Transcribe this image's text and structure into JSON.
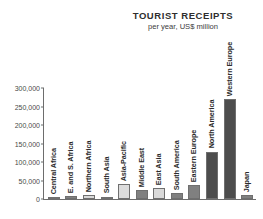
{
  "chart_data": {
    "type": "bar",
    "title": "TOURIST RECEIPTS",
    "subtitle": "per year, US$ million",
    "xlabel": "",
    "ylabel": "",
    "ylim": [
      0,
      300000
    ],
    "grid": false,
    "legend": "none",
    "ytick_labels": [
      "300,000",
      "250,000",
      "200,000",
      "150,000",
      "100,000",
      "50,000",
      "0"
    ],
    "ytick_values": [
      300000,
      250000,
      200000,
      150000,
      100000,
      50000,
      0
    ],
    "categories": [
      "Central Africa",
      "E. and S. Africa",
      "Northern Africa",
      "South Asia",
      "Asia-Pacific",
      "Middle East",
      "East Asia",
      "South America",
      "Eastern Europe",
      "North America",
      "Western Europe",
      "Japan"
    ],
    "values": [
      1500,
      7000,
      10000,
      6000,
      40000,
      24000,
      30000,
      16000,
      37000,
      128000,
      270000,
      10000
    ],
    "bar_colors": [
      "#808080",
      "#808080",
      "#d9d9d9",
      "#d9d9d9",
      "#dcdcdc",
      "#808080",
      "#d9d9d9",
      "#808080",
      "#808080",
      "#4d4d4d",
      "#4d4d4d",
      "#808080"
    ],
    "colors": {
      "light_bar": "#d9d9d9",
      "mid_bar": "#808080",
      "dark_bar": "#4d4d4d",
      "axis": "#6d6d6d",
      "text": "#2b2b2b",
      "background": "#ffffff"
    }
  }
}
